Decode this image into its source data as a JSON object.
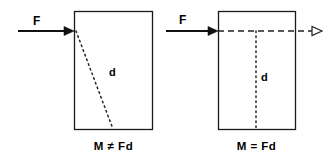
{
  "figure": {
    "panels": [
      {
        "id": "left",
        "caption": "M ≠ Fd",
        "force_label": "F",
        "distance_label": "d",
        "body_shape": "rectangle",
        "force_direction": "right",
        "line_of_action_style": "dotted-oblique",
        "note": "d measured obliquely, not perpendicular"
      },
      {
        "id": "right",
        "caption": "M = Fd",
        "force_label": "F",
        "distance_label": "d",
        "body_shape": "rectangle",
        "force_direction": "right",
        "line_of_action_style": "dashed-horizontal",
        "note": "d measured perpendicular to line of action"
      }
    ],
    "colors": {
      "background": "#ffffff",
      "stroke": "#1a1a1a",
      "text": "#000000"
    }
  }
}
